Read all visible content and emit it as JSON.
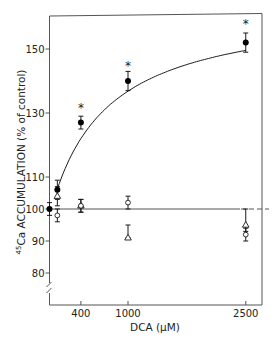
{
  "chart_data": {
    "type": "scatter",
    "title": "",
    "xlabel": "DCA (µM)",
    "ylabel_superscript": "45",
    "ylabel": "Ca ACCUMULATION  (% of control)",
    "ylabel_full": "45Ca ACCUMULATION (% of control)",
    "xlim": [
      0,
      2700
    ],
    "ylim": [
      70,
      160
    ],
    "x_ticks": [
      400,
      1000,
      2500
    ],
    "x_tick_labels": [
      "400",
      "1000",
      "2500"
    ],
    "y_ticks": [
      80,
      90,
      100,
      110,
      130,
      150
    ],
    "y_tick_labels": [
      "80",
      "90",
      "100",
      "110",
      "130",
      "150"
    ],
    "y_axis_break": true,
    "grid": false,
    "legend": "none",
    "reference_line": {
      "y": 100,
      "style": "solid, dashed at right end"
    },
    "series": [
      {
        "name": "filled circles",
        "marker": "filled-circle",
        "x": [
          0,
          100,
          400,
          1000,
          2500
        ],
        "values": [
          100,
          106,
          127,
          140,
          152
        ],
        "err_low": [
          98,
          103,
          125,
          137,
          149
        ],
        "err_high": [
          102,
          109,
          129,
          143,
          155
        ],
        "significant": [
          false,
          false,
          true,
          true,
          true
        ],
        "fit_curve": true
      },
      {
        "name": "open triangles",
        "marker": "open-triangle",
        "x": [
          100,
          400,
          1000,
          2500
        ],
        "values": [
          104,
          101,
          91,
          95
        ],
        "err_low": [
          101,
          99,
          91,
          93
        ],
        "err_high": [
          107,
          103,
          95,
          100
        ]
      },
      {
        "name": "open circles",
        "marker": "open-circle",
        "x": [
          100,
          400,
          1000,
          2500
        ],
        "values": [
          98,
          101,
          102,
          92
        ],
        "err_low": [
          96,
          99,
          100,
          90
        ],
        "err_high": [
          100,
          103,
          104,
          94
        ]
      }
    ],
    "annotations": [
      {
        "text": "*",
        "x": 400,
        "y": 132
      },
      {
        "text": "*",
        "x": 1000,
        "y": 145
      },
      {
        "text": "*",
        "x": 2500,
        "y": 158
      }
    ]
  }
}
